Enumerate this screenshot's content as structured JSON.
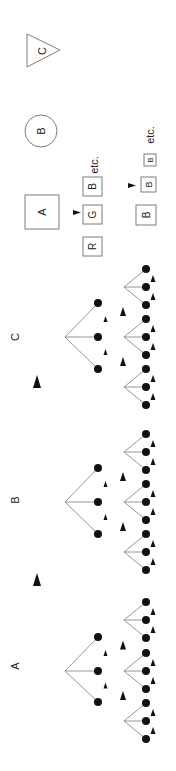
{
  "diagram": {
    "orientation": "rotated-90-ccw",
    "colors": {
      "node": "#111111",
      "edge": "#8a8a8a",
      "box_stroke": "#6e6e6e",
      "background": "#ffffff"
    },
    "groups": [
      {
        "label": "C",
        "label_pos": [
          15,
          337
        ],
        "root": [
          65,
          337
        ],
        "children_y": [
          303,
          337,
          369
        ],
        "hubs_y": [
          287,
          337,
          387
        ]
      },
      {
        "label": "B",
        "label_pos": [
          15,
          500
        ],
        "root": [
          65,
          502
        ],
        "children_y": [
          468,
          502,
          534
        ],
        "hubs_y": [
          452,
          502,
          552
        ]
      },
      {
        "label": "A",
        "label_pos": [
          15,
          666
        ],
        "root": [
          65,
          671
        ],
        "children_y": [
          637,
          671,
          702
        ],
        "hubs_y": [
          620,
          671,
          721
        ]
      }
    ],
    "group_arrows": [
      {
        "x": 37,
        "y": 382
      },
      {
        "x": 37,
        "y": 580
      }
    ],
    "legend": {
      "shapes": [
        {
          "type": "square",
          "label": "A"
        },
        {
          "type": "circle",
          "label": "B"
        },
        {
          "type": "triangle",
          "label": "C"
        }
      ],
      "row_rgb": {
        "boxes": [
          "R",
          "G",
          "B"
        ],
        "suffix": "etc."
      },
      "row_bbb": {
        "boxes": [
          "B",
          "B",
          "B"
        ],
        "suffix": "etc."
      }
    }
  }
}
